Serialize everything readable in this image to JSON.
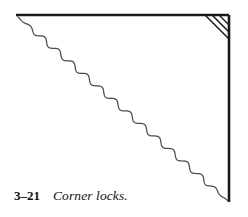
{
  "figure": {
    "caption_number": "3–21",
    "caption_text": "Corner locks.",
    "alt_description": "Line drawing of a fabric corner: a straight top edge and straight right edge meeting at a square corner, with three short parallel diagonal hatch lines across the inside of that corner, and a long gently wavy diagonal line running from the upper left down to the lower right.",
    "ink_color": "#1a1a1a",
    "wave_color": "#4a4a4a",
    "background_color": "#ffffff"
  },
  "drawing": {
    "top_edge": {
      "label": "top-edge",
      "x1": 16,
      "y1": 15,
      "x2": 229,
      "y2": 15,
      "stroke_width": 2.6
    },
    "right_edge": {
      "label": "right-edge",
      "x1": 229,
      "y1": 15,
      "x2": 229,
      "y2": 202,
      "stroke_width": 2.6
    },
    "corner_hatch_lines": [
      {
        "label": "corner-hatch-1",
        "x1": 206,
        "y1": 16,
        "x2": 228,
        "y2": 38,
        "stroke_width": 1.5
      },
      {
        "label": "corner-hatch-2",
        "x1": 213,
        "y1": 16,
        "x2": 228,
        "y2": 31,
        "stroke_width": 1.5
      },
      {
        "label": "corner-hatch-3",
        "x1": 220,
        "y1": 16,
        "x2": 228,
        "y2": 24,
        "stroke_width": 1.4
      }
    ],
    "wavy_diagonal": {
      "label": "wavy-diagonal-fold",
      "start_x": 18,
      "start_y": 17,
      "end_x": 228,
      "end_y": 201,
      "amplitude": 2.6,
      "wavelength": 19,
      "stroke_width": 1.25
    }
  },
  "chart_data": {
    "type": "line",
    "title": "Corner locks.",
    "xlabel": "",
    "ylabel": "",
    "xlim": [
      0,
      248
    ],
    "ylim": [
      0,
      217
    ],
    "grid": false,
    "legend": "none",
    "series": [
      {
        "name": "top-edge",
        "x": [
          16,
          229
        ],
        "y": [
          15,
          15
        ]
      },
      {
        "name": "right-edge",
        "x": [
          229,
          229
        ],
        "y": [
          15,
          202
        ]
      },
      {
        "name": "corner-hatch-1",
        "x": [
          206,
          228
        ],
        "y": [
          16,
          38
        ]
      },
      {
        "name": "corner-hatch-2",
        "x": [
          213,
          228
        ],
        "y": [
          16,
          31
        ]
      },
      {
        "name": "corner-hatch-3",
        "x": [
          220,
          228
        ],
        "y": [
          16,
          24
        ]
      },
      {
        "name": "wavy-diagonal-fold",
        "x": [
          18,
          228
        ],
        "y": [
          17,
          201
        ]
      }
    ],
    "annotations": [
      "3–21",
      "Corner locks."
    ]
  }
}
